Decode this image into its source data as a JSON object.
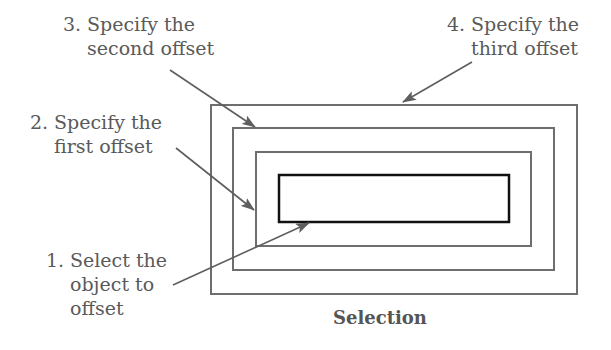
{
  "diagram": {
    "caption": "Selection",
    "colors": {
      "outline": "#6e6e6e",
      "selected_outline": "#111111",
      "text": "#5a5a5a",
      "arrow": "#5e5e5e"
    },
    "steps": [
      {
        "number": "1.",
        "line1": "Select the",
        "line2": "object to",
        "line3": "offset"
      },
      {
        "number": "2.",
        "line1": "Specify the",
        "line2": "first offset"
      },
      {
        "number": "3.",
        "line1": "Specify the",
        "line2": "second offset"
      },
      {
        "number": "4.",
        "line1": "Specify the",
        "line2": "third offset"
      }
    ],
    "rectangles": [
      {
        "name": "original-object",
        "x": 279,
        "y": 175,
        "w": 230,
        "h": 47
      },
      {
        "name": "first-offset",
        "x": 256,
        "y": 152,
        "w": 275,
        "h": 94
      },
      {
        "name": "second-offset",
        "x": 233,
        "y": 128,
        "w": 321,
        "h": 142
      },
      {
        "name": "third-offset",
        "x": 211,
        "y": 105,
        "w": 366,
        "h": 189
      }
    ]
  }
}
